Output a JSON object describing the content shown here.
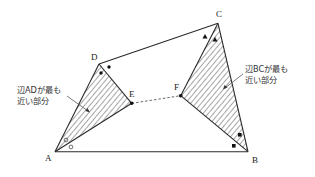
{
  "diagram": {
    "vertices": {
      "A": {
        "label": "A"
      },
      "B": {
        "label": "B"
      },
      "C": {
        "label": "C"
      },
      "D": {
        "label": "D"
      },
      "E": {
        "label": "E"
      },
      "F": {
        "label": "F"
      }
    },
    "annotations": {
      "left": {
        "line1": "辺ADが最も",
        "line2": "近い部分"
      },
      "right": {
        "line1": "辺BCが最も",
        "line2": "近い部分"
      }
    },
    "angle_marks": {
      "A": "circle",
      "D": "dot",
      "C": "triangle",
      "B": "square"
    },
    "colors": {
      "line": "#2a2a2a",
      "hatch": "#3a3a3a",
      "background": "#ffffff"
    }
  }
}
